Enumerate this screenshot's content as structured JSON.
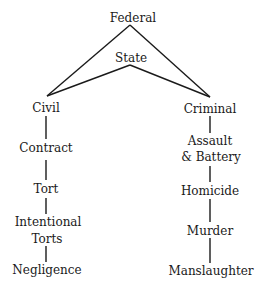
{
  "diagram": {
    "type": "hierarchy",
    "top": {
      "federal": "Federal",
      "state": "State"
    },
    "branches": {
      "civil": {
        "root": "Civil",
        "chain": [
          "Contract",
          "Tort",
          "Intentional Torts",
          "Negligence"
        ],
        "lines": [
          "Contract",
          "Tort",
          "Intentional",
          "Torts",
          "Negligence"
        ]
      },
      "criminal": {
        "root": "Criminal",
        "chain": [
          "Assault & Battery",
          "Homicide",
          "Murder",
          "Manslaughter"
        ],
        "lines": [
          "Assault",
          "& Battery",
          "Homicide",
          "Murder",
          "Manslaughter"
        ]
      }
    },
    "colors": {
      "ink": "#1a1a1a",
      "background": "#ffffff"
    }
  }
}
